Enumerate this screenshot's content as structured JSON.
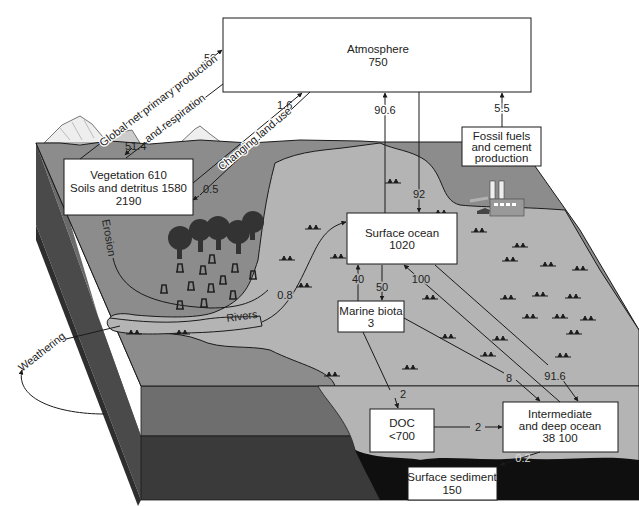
{
  "diagram": {
    "colors": {
      "background": "#ffffff",
      "land": "#8c8c8c",
      "sea": "#b4b4b4",
      "front_upper": "#6e6e6e",
      "front_lower": "#3a3a3a",
      "side_upper": "#555555",
      "side_lower": "#2e2e2e",
      "sediment": "#111111",
      "box_fill": "#ffffff",
      "line": "#1a1a1a"
    },
    "reservoirs": {
      "atmosphere": {
        "name": "Atmosphere",
        "value": "750"
      },
      "land": {
        "line1": "Vegetation 610",
        "line2": "Soils and detritus 1580",
        "line3": "2190"
      },
      "fossil": {
        "line1": "Fossil fuels",
        "line2": "and cement",
        "line3": "production"
      },
      "surface_ocean": {
        "name": "Surface ocean",
        "value": "1020"
      },
      "marine_biota": {
        "name": "Marine biota",
        "value": "3"
      },
      "doc": {
        "name": "DOC",
        "value": "<700"
      },
      "deep_ocean": {
        "line1": "Intermediate",
        "line2": "and deep ocean",
        "line3": "38 100"
      },
      "sediment": {
        "name": "Surface sediment",
        "value": "150"
      }
    },
    "fluxes": {
      "npp_up": "50",
      "npp_down": "51.4",
      "land_use_up": "1.6",
      "land_use_down": "0.5",
      "ocean_to_atm": "90.6",
      "atm_to_ocean": "92",
      "fossil_to_atm": "5.5",
      "rivers": "0.8",
      "biota_to_surface": "40",
      "surface_to_biota": "50",
      "deep_to_surface": "100",
      "surface_to_deep": "91.6",
      "biota_to_deep": "8",
      "biota_to_doc": "2",
      "doc_to_deep": "2",
      "deep_to_sediment": "0.2"
    },
    "labels": {
      "npp_line1": "Global net primary production",
      "npp_line2": "and respiration",
      "land_use": "Changing land use",
      "erosion": "Erosion",
      "rivers": "Rivers",
      "weathering": "Weathering"
    }
  }
}
